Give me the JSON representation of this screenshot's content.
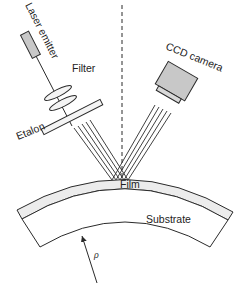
{
  "diagram": {
    "type": "optical-setup",
    "labels": {
      "laser": "Laser emitter",
      "filter": "Filter",
      "etalon": "Etalon",
      "camera": "CCD camera",
      "film": "Film",
      "substrate": "Substrate",
      "radius": "ρ"
    },
    "colors": {
      "stroke": "#2a2a2a",
      "component_fill": "#c8c8c8",
      "film_fill": "#ececec",
      "background": "#ffffff"
    }
  }
}
